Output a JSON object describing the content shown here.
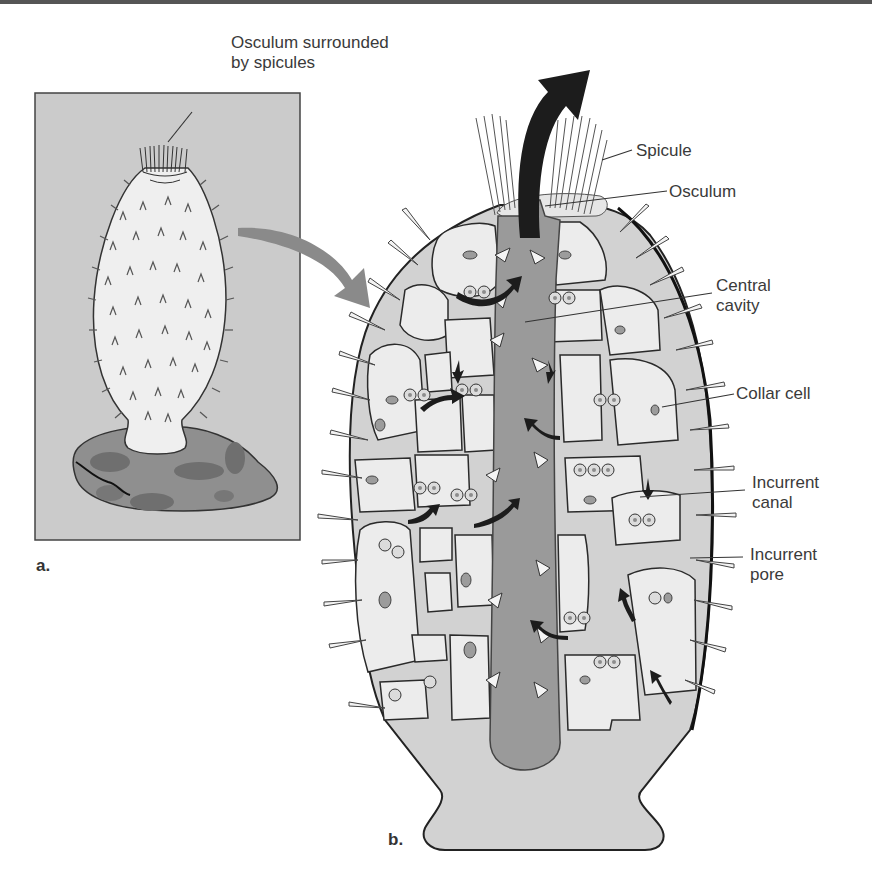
{
  "figure": {
    "panel_a": {
      "letter": "a.",
      "callout": {
        "line1": "Osculum surrounded",
        "line2": "by spicules"
      }
    },
    "panel_b": {
      "letter": "b.",
      "labels": [
        {
          "id": "spicule",
          "line1": "Spicule",
          "line2": ""
        },
        {
          "id": "osculum",
          "line1": "Osculum",
          "line2": ""
        },
        {
          "id": "central-cavity",
          "line1": "Central",
          "line2": "cavity"
        },
        {
          "id": "collar-cell",
          "line1": "Collar cell",
          "line2": ""
        },
        {
          "id": "incurrent-canal",
          "line1": "Incurrent",
          "line2": "canal"
        },
        {
          "id": "incurrent-pore",
          "line1": "Incurrent",
          "line2": "pore"
        }
      ]
    },
    "colors": {
      "panel_bg": "#c9c9c9",
      "sponge_body": "#ececec",
      "mesohyl": "#c4c4c4",
      "central_cavity": "#9a9a9a",
      "rock": "#8e8e8e",
      "outline": "#2a2a2a",
      "arrow_gray": "#8a8a8a",
      "arrow_dark": "#1c1c1c"
    }
  }
}
